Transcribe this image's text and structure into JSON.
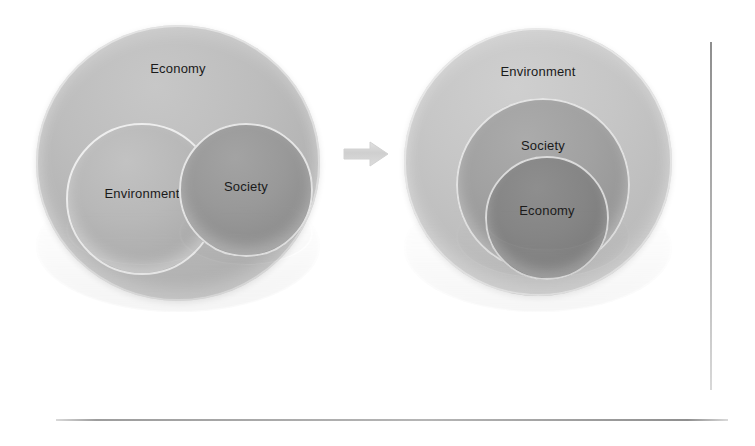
{
  "diagram": {
    "type": "venn-to-nested-circles",
    "background_color": "#ffffff",
    "label_color": "#1a1a1a",
    "left_model": {
      "name": "overlapping-circles-model",
      "outer": {
        "label": "Economy",
        "color": "#b8b8b8"
      },
      "inner": [
        {
          "label": "Environment",
          "color": "#b3b3b3",
          "position": "left"
        },
        {
          "label": "Society",
          "color": "#949494",
          "position": "right"
        }
      ]
    },
    "arrow": {
      "name": "right-arrow",
      "direction": "right",
      "color": "#d0d0d0"
    },
    "right_model": {
      "name": "nested-circles-model",
      "rings": [
        {
          "label": "Environment",
          "color": "#c4c4c4",
          "level": "outer"
        },
        {
          "label": "Society",
          "color": "#9e9e9e",
          "level": "middle"
        },
        {
          "label": "Economy",
          "color": "#828282",
          "level": "inner"
        }
      ]
    },
    "frame": {
      "vertical_rule_color": "#a8a8a8",
      "horizontal_rule_color": "#a0a0a0"
    }
  }
}
